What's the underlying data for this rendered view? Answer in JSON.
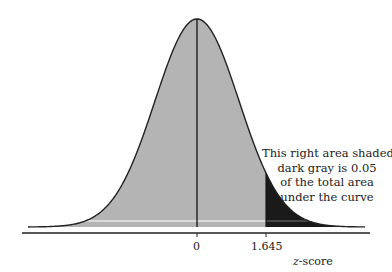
{
  "chart_data": {
    "type": "area",
    "title": "",
    "xlabel_italic": "z",
    "xlabel_rest": "-score",
    "xlabel": "z-score",
    "ylabel": "",
    "x_ticks": [
      {
        "value": 0,
        "label": "0"
      },
      {
        "value": 1.645,
        "label": "1.645"
      }
    ],
    "distribution": {
      "mean": 0,
      "sd": 1
    },
    "shaded_regions": [
      {
        "from": "-inf",
        "to": 1.645,
        "color": "#b4b4b4",
        "area": 0.95
      },
      {
        "from": 1.645,
        "to": "inf",
        "color": "#1a1a1a",
        "area": 0.05
      }
    ],
    "vertical_lines": [
      0,
      1.645
    ],
    "annotation": {
      "lines": [
        "This right area shaded",
        "dark gray is 0.05",
        "of the total area",
        "under the curve"
      ]
    },
    "grid": false,
    "legend": null
  },
  "colors": {
    "light_fill": "#b4b4b4",
    "dark_fill": "#1a1a1a",
    "stroke": "#222222"
  }
}
